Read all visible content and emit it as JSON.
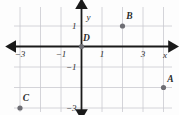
{
  "chart_data": {
    "type": "scatter",
    "title": "",
    "xlabel": "x",
    "ylabel": "y",
    "xlim": [
      -5,
      5
    ],
    "ylim": [
      -4.5,
      2.5
    ],
    "grid": true,
    "grid_spacing": 1,
    "legend": "none",
    "axis_style": "double-arrow-cartesian",
    "x_ticks": [
      -3,
      -1,
      1,
      3
    ],
    "x_tick_labels": [
      "−3",
      "−1",
      "1",
      "3"
    ],
    "y_ticks": [
      1,
      -1,
      -3
    ],
    "y_tick_labels": [
      "1",
      "−1",
      "−3"
    ],
    "points": [
      {
        "label": "A",
        "x": 4,
        "y": -2,
        "label_dx": 7,
        "label_dy": -6
      },
      {
        "label": "B",
        "x": 2,
        "y": 1,
        "label_dx": 7,
        "label_dy": -7
      },
      {
        "label": "C",
        "x": -3,
        "y": -3,
        "label_dx": 6,
        "label_dy": -7
      },
      {
        "label": "D",
        "x": 0,
        "y": 0,
        "label_dx": 5,
        "label_dy": -6
      }
    ]
  },
  "colors": {
    "grid": "#c9c9cf",
    "axis": "#1a1a1a",
    "point": "#6e6e74",
    "text": "#2b2b2b",
    "background": "#fdfdfd"
  },
  "axis_names": {
    "x": "x",
    "y": "y"
  }
}
